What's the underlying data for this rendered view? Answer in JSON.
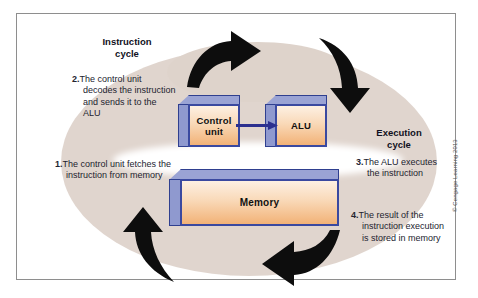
{
  "figure": {
    "copyright": "© Cengage Learning 2013"
  },
  "colors": {
    "blob_beige": "#ded3cb",
    "box_front_light": "#fdf0e3",
    "box_front_dark": "#f2b277",
    "box_edge_blue": "#3a49a0",
    "box_side_blue": "#8f99cf",
    "arrow_black": "#111111",
    "connector_blue": "#2b2f8f",
    "frame_border": "#8e8e8e"
  },
  "components": [
    {
      "id": "control-unit",
      "label_line1": "Control",
      "label_line2": "unit"
    },
    {
      "id": "alu",
      "label_line1": "ALU",
      "label_line2": ""
    },
    {
      "id": "memory",
      "label_line1": "Memory",
      "label_line2": ""
    }
  ],
  "cycles": [
    {
      "id": "instruction-cycle",
      "line1": "Instruction",
      "line2": "cycle"
    },
    {
      "id": "execution-cycle",
      "line1": "Execution",
      "line2": "cycle"
    }
  ],
  "steps": [
    {
      "id": "step-1",
      "number": "1.",
      "text": "The control unit fetches the instruction from memory"
    },
    {
      "id": "step-2",
      "number": "2.",
      "text": "The control unit decodes the instruction and sends it to the ALU"
    },
    {
      "id": "step-3",
      "number": "3.",
      "text": "The ALU executes the instruction"
    },
    {
      "id": "step-4",
      "number": "4.",
      "text": "The result of the instruction execution is stored in memory"
    }
  ],
  "arrows": [
    {
      "id": "arrow-top-left",
      "direction": "right",
      "meaning": "memory-to-control-unit-flow"
    },
    {
      "id": "arrow-top-right",
      "direction": "down",
      "meaning": "control-unit-to-alu-flow"
    },
    {
      "id": "arrow-bottom-left",
      "direction": "up",
      "meaning": "fetch-from-memory-flow"
    },
    {
      "id": "arrow-bottom-right",
      "direction": "left",
      "meaning": "store-result-to-memory-flow"
    }
  ],
  "connector": {
    "id": "control-unit-to-alu-connector",
    "direction": "right"
  }
}
